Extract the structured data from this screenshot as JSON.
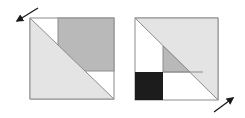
{
  "diagram": {
    "colors": {
      "outline": "#8c8c8c",
      "light_fill": "#e4e4e4",
      "mid_fill": "#b9b9b9",
      "dark_fill": "#1c1c1c",
      "white": "#ffffff",
      "arrow": "#1a1a1a"
    },
    "left_block": {
      "square": [
        30,
        18,
        84,
        81
      ],
      "arrow_direction": "up-left"
    },
    "right_block": {
      "square": [
        135,
        18,
        83,
        82
      ],
      "arrow_direction": "down-right"
    }
  }
}
